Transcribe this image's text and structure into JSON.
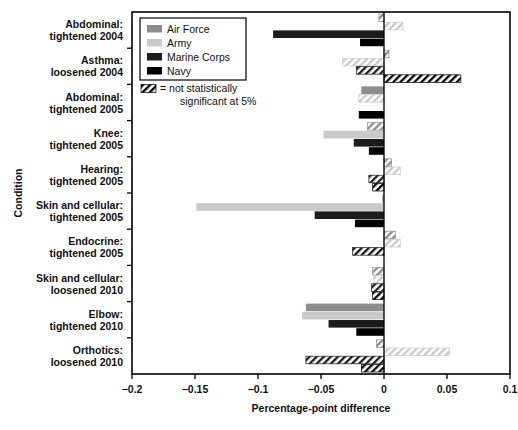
{
  "chart_data": {
    "type": "bar",
    "orientation": "horizontal",
    "title": "",
    "xlabel": "Percentage-point difference",
    "ylabel": "Condition",
    "xlim": [
      -0.2,
      0.1
    ],
    "xticks": [
      -0.2,
      -0.15,
      -0.1,
      -0.05,
      0,
      0.05,
      0.1
    ],
    "xticklabels": [
      "−0.2",
      "−0.15",
      "−0.1",
      "−0.05",
      "0",
      "0.05",
      "0.1"
    ],
    "grid": false,
    "legend_position": "upper left",
    "legend": [
      {
        "name": "Air Force",
        "color": "#8c8c8c"
      },
      {
        "name": "Army",
        "color": "#c9c9c9"
      },
      {
        "name": "Marine Corps",
        "color": "#1c1c1c"
      },
      {
        "name": "Navy",
        "color": "#000000"
      }
    ],
    "note": "= not statistically significant at 5%",
    "categories": [
      "Abdominal:\ntightened 2004",
      "Asthma:\nloosened 2004",
      "Abdominal:\ntightened 2005",
      "Knee:\ntightened 2005",
      "Hearing:\ntightened 2005",
      "Skin and cellular:\ntightened 2005",
      "Endocrine:\ntightened 2005",
      "Skin and cellular:\nloosened 2010",
      "Elbow:\ntightened 2010",
      "Orthotics:\nloosened 2010"
    ],
    "categories_lines": [
      [
        "Abdominal:",
        "tightened 2004"
      ],
      [
        "Asthma:",
        "loosened 2004"
      ],
      [
        "Abdominal:",
        "tightened 2005"
      ],
      [
        "Knee:",
        "tightened 2005"
      ],
      [
        "Hearing:",
        "tightened 2005"
      ],
      [
        "Skin and cellular:",
        "tightened 2005"
      ],
      [
        "Endocrine:",
        "tightened 2005"
      ],
      [
        "Skin and cellular:",
        "loosened 2010"
      ],
      [
        "Elbow:",
        "tightened 2010"
      ],
      [
        "Orthotics:",
        "loosened 2010"
      ]
    ],
    "series": [
      {
        "name": "Air Force",
        "color": "#8c8c8c",
        "values": [
          -0.004,
          0.004,
          -0.018,
          -0.013,
          0.006,
          -0.001,
          0.009,
          -0.009,
          -0.062,
          -0.006
        ],
        "hatched": [
          true,
          true,
          false,
          true,
          true,
          true,
          true,
          true,
          false,
          true
        ]
      },
      {
        "name": "Army",
        "color": "#c9c9c9",
        "values": [
          0.015,
          -0.033,
          -0.02,
          -0.048,
          0.013,
          -0.149,
          0.013,
          -0.008,
          -0.065,
          0.052
        ],
        "hatched": [
          true,
          true,
          true,
          false,
          true,
          false,
          true,
          true,
          false,
          true
        ]
      },
      {
        "name": "Marine Corps",
        "color": "#1c1c1c",
        "values": [
          -0.088,
          -0.022,
          0.0,
          -0.024,
          -0.012,
          -0.055,
          -0.025,
          -0.01,
          -0.044,
          -0.062
        ],
        "hatched": [
          false,
          true,
          false,
          false,
          true,
          false,
          true,
          true,
          false,
          true
        ]
      },
      {
        "name": "Navy",
        "color": "#000000",
        "values": [
          -0.019,
          0.061,
          -0.02,
          -0.012,
          -0.009,
          -0.023,
          0.0,
          -0.009,
          -0.022,
          -0.018
        ],
        "hatched": [
          false,
          true,
          false,
          false,
          true,
          false,
          false,
          true,
          false,
          true
        ]
      }
    ]
  }
}
